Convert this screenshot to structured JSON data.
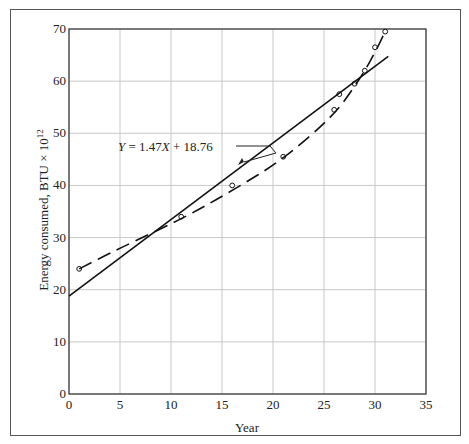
{
  "chart_data": {
    "type": "scatter",
    "title": "",
    "xlabel": "Year",
    "ylabel": "Energy consumed, BTU × 10¹²",
    "xlim": [
      0,
      35
    ],
    "ylim": [
      0,
      70
    ],
    "xticks": [
      0,
      5,
      10,
      15,
      20,
      25,
      30,
      35
    ],
    "yticks": [
      0,
      10,
      20,
      30,
      40,
      50,
      60,
      70
    ],
    "grid": true,
    "series": [
      {
        "name": "Observed data",
        "style": "open-circle markers",
        "x": [
          1,
          11,
          16,
          21,
          26,
          26.5,
          28,
          29,
          30,
          31
        ],
        "y": [
          24,
          34,
          40,
          45.5,
          54.5,
          57.5,
          59.5,
          62,
          66.5,
          69.5
        ]
      },
      {
        "name": "Linear fit",
        "style": "solid line",
        "equation": "Y = 1.47X + 18.76",
        "x": [
          0,
          31.3
        ],
        "y": [
          18.76,
          64.77
        ]
      },
      {
        "name": "Curve fit",
        "style": "dashed line",
        "x": [
          1,
          5,
          11,
          16,
          21,
          26,
          28,
          29,
          30,
          31
        ],
        "y": [
          24,
          28,
          33.5,
          39,
          45,
          53.5,
          59,
          62,
          65.5,
          69.5
        ]
      }
    ],
    "annotations": [
      {
        "text": "Y = 1.47X + 18.76",
        "points_to": "Linear fit",
        "at": [
          17.5,
          44.5
        ]
      }
    ]
  },
  "labels": {
    "x_axis": "Year",
    "y_axis_prefix": "Energy consumed, BTU × 10",
    "y_axis_exp": "12",
    "equation_Y": "Y",
    "equation_mid": " = 1.47",
    "equation_X": "X",
    "equation_end": " + 18.76"
  }
}
